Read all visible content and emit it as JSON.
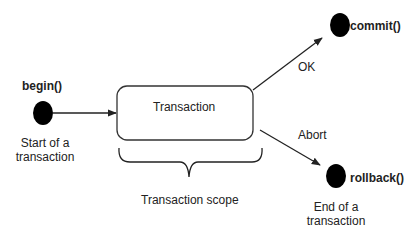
{
  "diagram": {
    "states": {
      "begin": {
        "label": "begin()",
        "caption": [
          "Start of a",
          "transaction"
        ]
      },
      "transaction": {
        "label": "Transaction"
      },
      "commit": {
        "label": "commit()"
      },
      "rollback": {
        "label": "rollback()",
        "caption": [
          "End of a",
          "transaction"
        ]
      }
    },
    "transitions": {
      "ok": {
        "label": "OK"
      },
      "abort": {
        "label": "Abort"
      }
    },
    "brace_label": "Transaction scope",
    "colors": {
      "line": "#222222",
      "node": "#000000",
      "box_border": "#333333"
    }
  }
}
